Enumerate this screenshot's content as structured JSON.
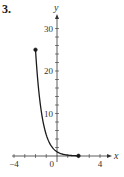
{
  "problem": {
    "number": "3."
  },
  "chart_data": {
    "type": "line",
    "title": "",
    "xlabel": "x",
    "ylabel": "y",
    "xlim": [
      -5,
      5
    ],
    "ylim": [
      -1,
      33
    ],
    "x_ticks": [
      -4,
      -3,
      -2,
      -1,
      0,
      1,
      2,
      3,
      4
    ],
    "x_tick_labels": [
      {
        "value": -4,
        "label": "−4"
      },
      {
        "value": 0,
        "label": "0"
      },
      {
        "value": 4,
        "label": "4"
      }
    ],
    "y_ticks": [
      2,
      4,
      6,
      8,
      10,
      12,
      14,
      16,
      18,
      20,
      22,
      24,
      26,
      28,
      30
    ],
    "y_tick_labels": [
      {
        "value": 10,
        "label": "10"
      },
      {
        "value": 20,
        "label": "20"
      },
      {
        "value": 30,
        "label": "30"
      }
    ],
    "grid": false,
    "series": [
      {
        "name": "f(x) = (1/5)^x",
        "domain": [
          -2,
          2
        ],
        "base": 0.2,
        "endpoints": [
          {
            "x": -2,
            "y": 25,
            "closed": true
          },
          {
            "x": 2,
            "y": 0.04,
            "closed": true
          }
        ]
      }
    ],
    "colors": {
      "curve": "#1a1a1a",
      "axis": "#333333"
    }
  }
}
